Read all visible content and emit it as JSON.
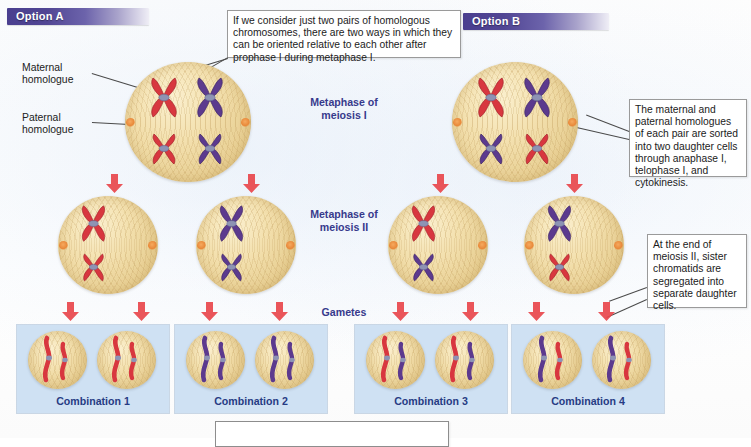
{
  "figure": {
    "title_hidden": "Independent assortment of homologous chromosomes in meiosis",
    "colors": {
      "maternal_chromosome": "#d8373f",
      "paternal_chromosome": "#5c3a8e",
      "cell_cytoplasm": "#f0dca8",
      "gamete_panel": "#cfe1f3",
      "arrow": "#e8474c",
      "option_bar": "#4a3f8f",
      "stage_label_text": "#373a8c",
      "combination_label_text": "#263b83",
      "centromere": "#8e93b4"
    }
  },
  "options": [
    {
      "id": "option-a",
      "label": "Option A"
    },
    {
      "id": "option-b",
      "label": "Option B"
    }
  ],
  "side_labels": [
    {
      "id": "maternal",
      "line1": "Maternal",
      "line2": "homologue"
    },
    {
      "id": "paternal",
      "line1": "Paternal",
      "line2": "homologue"
    }
  ],
  "stage_labels": [
    {
      "id": "metaphase-i",
      "line1": "Metaphase of",
      "line2": "meiosis I"
    },
    {
      "id": "metaphase-ii",
      "line1": "Metaphase of",
      "line2": "meiosis II"
    },
    {
      "id": "gametes",
      "line1": "Gametes",
      "line2": ""
    }
  ],
  "callouts": [
    {
      "id": "callout-top",
      "text": "If we consider just two pairs of homologous chromosomes, there are two ways in which they can be oriented relative to each other after prophase I during metaphase I."
    },
    {
      "id": "callout-right-upper",
      "text": "The maternal and paternal homologues of each pair are sorted into two daughter cells through anaphase I, telophase I, and cytokinesis."
    },
    {
      "id": "callout-right-lower",
      "text": "At the end of meiosis II, sister chromatids are segregated into separate daughter cells."
    },
    {
      "id": "callout-bottom",
      "text": ""
    }
  ],
  "gametes": [
    {
      "id": "combination-1",
      "label": "Combination 1",
      "cells": [
        [
          "maternal",
          "maternal"
        ],
        [
          "maternal",
          "maternal"
        ]
      ]
    },
    {
      "id": "combination-2",
      "label": "Combination 2",
      "cells": [
        [
          "paternal",
          "paternal"
        ],
        [
          "paternal",
          "paternal"
        ]
      ]
    },
    {
      "id": "combination-3",
      "label": "Combination 3",
      "cells": [
        [
          "maternal",
          "paternal"
        ],
        [
          "maternal",
          "paternal"
        ]
      ]
    },
    {
      "id": "combination-4",
      "label": "Combination 4",
      "cells": [
        [
          "paternal",
          "maternal"
        ],
        [
          "paternal",
          "maternal"
        ]
      ]
    }
  ],
  "meiosis_i_cells": [
    {
      "id": "option-a-metaphase-i",
      "chromosomes": [
        {
          "pos": "top-left",
          "color": "maternal",
          "size": "large"
        },
        {
          "pos": "top-right",
          "color": "paternal",
          "size": "large"
        },
        {
          "pos": "bottom-left",
          "color": "maternal",
          "size": "small"
        },
        {
          "pos": "bottom-right",
          "color": "paternal",
          "size": "small"
        }
      ]
    },
    {
      "id": "option-b-metaphase-i",
      "chromosomes": [
        {
          "pos": "top-left",
          "color": "maternal",
          "size": "large"
        },
        {
          "pos": "top-right",
          "color": "paternal",
          "size": "large"
        },
        {
          "pos": "bottom-left",
          "color": "paternal",
          "size": "small"
        },
        {
          "pos": "bottom-right",
          "color": "maternal",
          "size": "small"
        }
      ]
    }
  ],
  "meiosis_ii_cells": [
    {
      "id": "metaphase-ii-cell-1",
      "chromosomes": [
        {
          "pos": "top",
          "color": "maternal",
          "size": "large"
        },
        {
          "pos": "bottom",
          "color": "maternal",
          "size": "small"
        }
      ]
    },
    {
      "id": "metaphase-ii-cell-2",
      "chromosomes": [
        {
          "pos": "top",
          "color": "paternal",
          "size": "large"
        },
        {
          "pos": "bottom",
          "color": "paternal",
          "size": "small"
        }
      ]
    },
    {
      "id": "metaphase-ii-cell-3",
      "chromosomes": [
        {
          "pos": "top",
          "color": "maternal",
          "size": "large"
        },
        {
          "pos": "bottom",
          "color": "paternal",
          "size": "small"
        }
      ]
    },
    {
      "id": "metaphase-ii-cell-4",
      "chromosomes": [
        {
          "pos": "top",
          "color": "paternal",
          "size": "large"
        },
        {
          "pos": "bottom",
          "color": "maternal",
          "size": "small"
        }
      ]
    }
  ]
}
